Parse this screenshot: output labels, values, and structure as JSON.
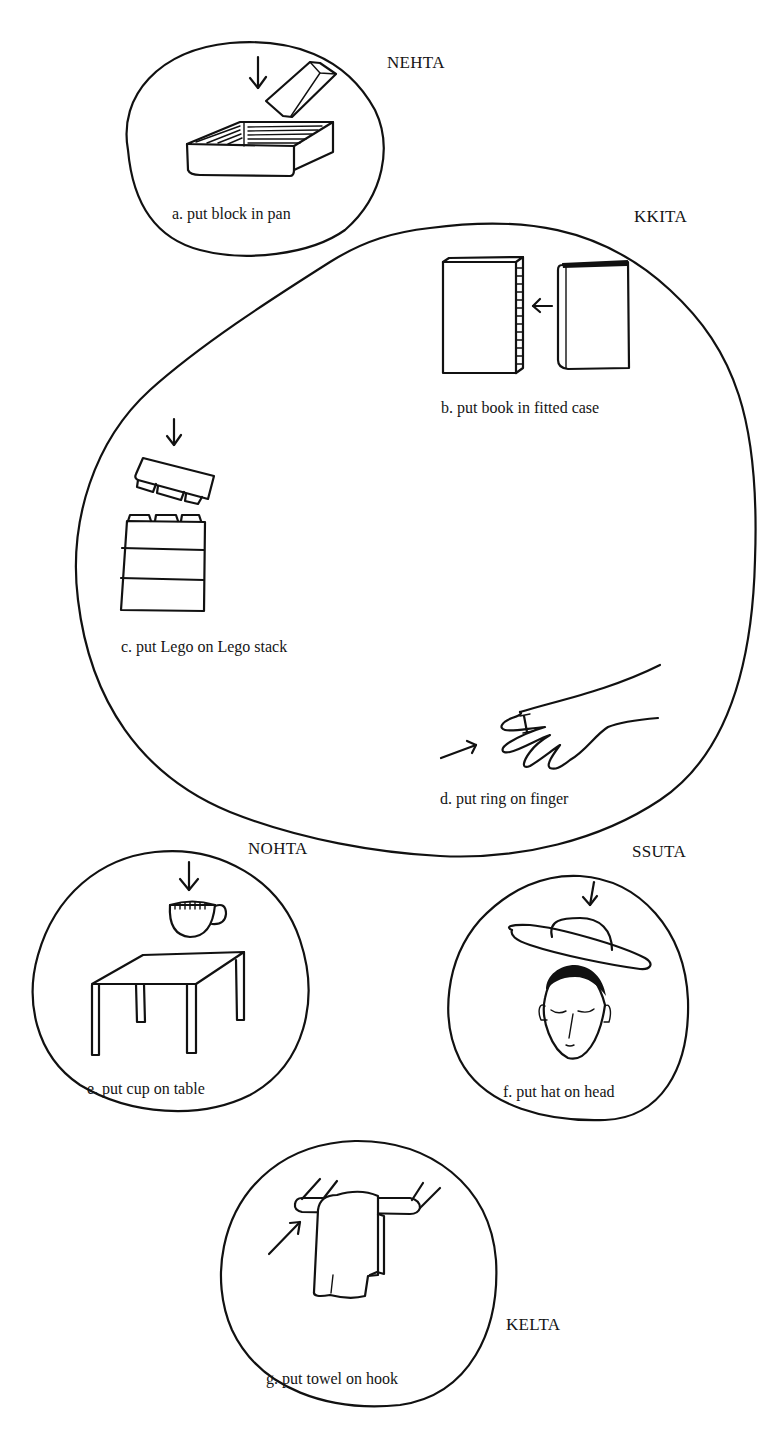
{
  "figure": {
    "type": "hand-drawn semantic category diagram",
    "categories": [
      {
        "id": "nehta",
        "name": "NEHTA",
        "items": [
          {
            "id": "a",
            "label": "a. put block in pan",
            "icons": [
              "down-arrow",
              "block",
              "pan"
            ]
          }
        ]
      },
      {
        "id": "kkita",
        "name": "KKITA",
        "items": [
          {
            "id": "b",
            "label": "b. put book in fitted case",
            "icons": [
              "book-case",
              "left-arrow",
              "book"
            ]
          },
          {
            "id": "c",
            "label": "c. put Lego on Lego stack",
            "icons": [
              "down-arrow",
              "lego-brick",
              "lego-stack"
            ]
          },
          {
            "id": "d",
            "label": "d. put ring on finger",
            "icons": [
              "right-arrow",
              "hand",
              "ring"
            ]
          }
        ]
      },
      {
        "id": "nohta",
        "name": "NOHTA",
        "items": [
          {
            "id": "e",
            "label": "e. put cup on table",
            "icons": [
              "down-arrow",
              "cup",
              "table"
            ]
          }
        ]
      },
      {
        "id": "ssuta",
        "name": "SSUTA",
        "items": [
          {
            "id": "f",
            "label": "f. put hat on head",
            "icons": [
              "down-arrow",
              "hat",
              "head"
            ]
          }
        ]
      },
      {
        "id": "kelta",
        "name": "KELTA",
        "items": [
          {
            "id": "g",
            "label": "g. put towel on hook",
            "icons": [
              "diagonal-arrow",
              "towel",
              "hook-rail"
            ]
          }
        ]
      }
    ],
    "caption_partial": "(caption cut off at bottom edge)"
  },
  "colors": {
    "ink": "#111111",
    "background": "#ffffff"
  }
}
